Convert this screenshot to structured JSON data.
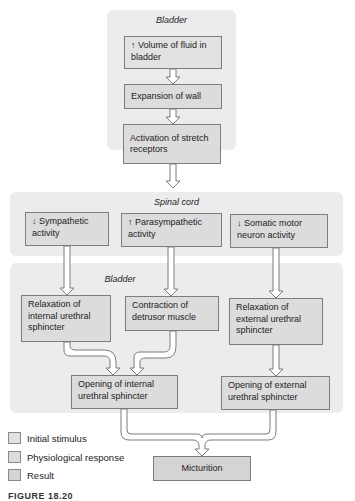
{
  "panels": {
    "bladder_top": "Bladder",
    "spinal_cord": "Spinal cord",
    "bladder_bottom": "Bladder"
  },
  "boxes": {
    "volume": "↑ Volume of fluid in bladder",
    "expansion": "Expansion of wall",
    "activation": "Activation of stretch receptors",
    "sympathetic": "↓ Sympathetic activity",
    "parasympathetic": "↑ Parasympathetic activity",
    "somatic": "↓ Somatic motor neuron activity",
    "relax_internal": "Relaxation of internal urethral sphincter",
    "contraction": "Contraction of detrusor muscle",
    "relax_external": "Relaxation of external urethral sphincter",
    "open_internal": "Opening of internal urethral sphincter",
    "open_external": "Opening of external urethral sphincter",
    "micturition": "Micturition"
  },
  "legend": [
    {
      "label": "Initial stimulus",
      "color": "#e2e2e2"
    },
    {
      "label": "Physiological response",
      "color": "#dcdcdc"
    },
    {
      "label": "Result",
      "color": "#d4d4d4"
    }
  ],
  "caption": "FIGURE 18.20"
}
